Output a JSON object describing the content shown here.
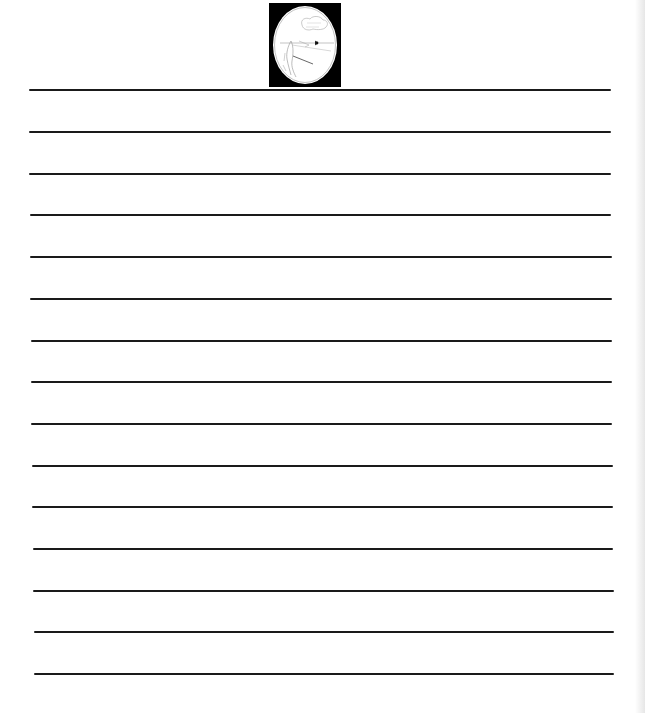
{
  "document": {
    "type": "lined writing paper",
    "emblem": {
      "icon": "archer-figure-oval-emblem-icon",
      "frame_color": "#000000",
      "oval_color": "#ffffff"
    },
    "ruled_lines": {
      "count": 15,
      "color": "#1a1a1a",
      "lines": [
        {
          "y": 89,
          "x1": 29,
          "x2": 611
        },
        {
          "y": 131,
          "x1": 29,
          "x2": 611
        },
        {
          "y": 173,
          "x1": 29,
          "x2": 611
        },
        {
          "y": 214,
          "x1": 30,
          "x2": 611
        },
        {
          "y": 256,
          "x1": 30,
          "x2": 612
        },
        {
          "y": 298,
          "x1": 30,
          "x2": 612
        },
        {
          "y": 340,
          "x1": 31,
          "x2": 612
        },
        {
          "y": 381,
          "x1": 31,
          "x2": 612
        },
        {
          "y": 423,
          "x1": 31,
          "x2": 612
        },
        {
          "y": 465,
          "x1": 32,
          "x2": 613
        },
        {
          "y": 506,
          "x1": 32,
          "x2": 613
        },
        {
          "y": 548,
          "x1": 33,
          "x2": 613
        },
        {
          "y": 590,
          "x1": 33,
          "x2": 614
        },
        {
          "y": 631,
          "x1": 34,
          "x2": 614
        },
        {
          "y": 673,
          "x1": 34,
          "x2": 614
        }
      ]
    }
  }
}
